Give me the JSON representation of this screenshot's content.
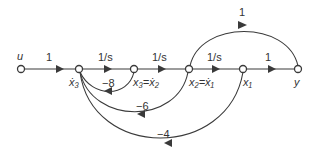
{
  "diagram": {
    "type": "signal-flow-graph",
    "nodes": [
      {
        "id": "u",
        "label": "u"
      },
      {
        "id": "x3dot",
        "label": "ẋ₃"
      },
      {
        "id": "x3",
        "label": "x₃=ẋ₂"
      },
      {
        "id": "x2",
        "label": "x₂=ẋ₁"
      },
      {
        "id": "x1",
        "label": "x₁"
      },
      {
        "id": "y",
        "label": "y"
      }
    ],
    "edges": [
      {
        "from": "u",
        "to": "x3dot",
        "gain": "1"
      },
      {
        "from": "x3dot",
        "to": "x3",
        "gain": "1/s"
      },
      {
        "from": "x3",
        "to": "x2",
        "gain": "1/s"
      },
      {
        "from": "x2",
        "to": "x1",
        "gain": "1/s"
      },
      {
        "from": "x1",
        "to": "y",
        "gain": "1"
      },
      {
        "from": "x2",
        "to": "y",
        "gain": "1"
      },
      {
        "from": "x3",
        "to": "x3dot",
        "gain": "−8"
      },
      {
        "from": "x2",
        "to": "x3dot",
        "gain": "−6"
      },
      {
        "from": "x1",
        "to": "x3dot",
        "gain": "−4"
      }
    ]
  }
}
